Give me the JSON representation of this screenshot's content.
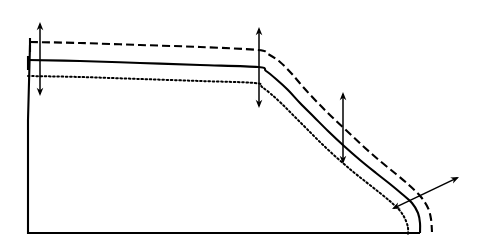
{
  "figure": {
    "type": "line-diagram",
    "width": 485,
    "height": 249,
    "background_color": "#ffffff",
    "stroke_color": "#000000"
  },
  "chart_data": {
    "type": "line",
    "title": "",
    "xlabel": "",
    "ylabel": "",
    "grid": false,
    "legend": "none",
    "xlim": [
      0,
      485
    ],
    "ylim": [
      0,
      249
    ],
    "note": "Three profile curves (dashed, solid, dotted) sharing a flat upper plateau, a step/kink near x=260, an S-shaped descent, and a near-vertical tail meeting the baseline. Coordinates are in image pixel space with y increasing downward.",
    "series": [
      {
        "name": "upper-profile-dashed",
        "style": "dashed",
        "dash_pattern": "8 4",
        "stroke_width": 2.1,
        "points": [
          [
            30,
            42
          ],
          [
            80,
            43
          ],
          [
            140,
            45
          ],
          [
            200,
            47
          ],
          [
            258,
            50
          ],
          [
            268,
            54
          ],
          [
            280,
            62
          ],
          [
            292,
            74
          ],
          [
            304,
            88
          ],
          [
            318,
            103
          ],
          [
            332,
            117
          ],
          [
            348,
            132
          ],
          [
            364,
            147
          ],
          [
            380,
            161
          ],
          [
            396,
            174
          ],
          [
            410,
            186
          ],
          [
            421,
            197
          ],
          [
            428,
            208
          ],
          [
            431,
            219
          ],
          [
            432,
            232
          ]
        ]
      },
      {
        "name": "middle-profile-solid",
        "style": "solid",
        "dash_pattern": "none",
        "stroke_width": 2.1,
        "points": [
          [
            28,
            60
          ],
          [
            80,
            61
          ],
          [
            140,
            63
          ],
          [
            200,
            65
          ],
          [
            258,
            67
          ],
          [
            266,
            71
          ],
          [
            276,
            79
          ],
          [
            288,
            90
          ],
          [
            300,
            103
          ],
          [
            314,
            117
          ],
          [
            328,
            131
          ],
          [
            344,
            146
          ],
          [
            360,
            160
          ],
          [
            376,
            173
          ],
          [
            390,
            184
          ],
          [
            402,
            194
          ],
          [
            412,
            203
          ],
          [
            418,
            213
          ],
          [
            420,
            223
          ],
          [
            420,
            233
          ]
        ]
      },
      {
        "name": "lower-profile-dotted",
        "style": "dotted",
        "dash_pattern": "1.6 2.6",
        "stroke_width": 2.0,
        "points": [
          [
            28,
            76
          ],
          [
            80,
            77
          ],
          [
            140,
            79
          ],
          [
            200,
            81
          ],
          [
            255,
            83
          ],
          [
            262,
            87
          ],
          [
            271,
            94
          ],
          [
            282,
            104
          ],
          [
            294,
            116
          ],
          [
            307,
            129
          ],
          [
            321,
            143
          ],
          [
            336,
            157
          ],
          [
            351,
            170
          ],
          [
            366,
            182
          ],
          [
            380,
            193
          ],
          [
            392,
            203
          ],
          [
            401,
            212
          ],
          [
            406,
            221
          ],
          [
            408,
            228
          ],
          [
            408,
            234
          ]
        ]
      }
    ],
    "domain_boundary": {
      "name": "flow-domain-outline",
      "style": "solid",
      "stroke_width": 2.1,
      "points": [
        [
          30,
          45
        ],
        [
          28,
          120
        ],
        [
          28,
          233
        ],
        [
          420,
          233
        ]
      ]
    },
    "annotations": [
      {
        "name": "left-gap-arrow",
        "kind": "double-headed-arrow",
        "orientation": "vertical",
        "x1": 40,
        "y1": 22,
        "x2": 40,
        "y2": 96
      },
      {
        "name": "step-gap-arrow",
        "kind": "double-headed-arrow",
        "orientation": "vertical",
        "x1": 259,
        "y1": 27,
        "x2": 259,
        "y2": 108
      },
      {
        "name": "midspan-gap-arrow",
        "kind": "double-headed-arrow",
        "orientation": "vertical",
        "x1": 343,
        "y1": 92,
        "x2": 343,
        "y2": 164
      },
      {
        "name": "tail-gap-arrow",
        "kind": "double-headed-arrow",
        "orientation": "diagonal",
        "x1": 392,
        "y1": 209,
        "x2": 459,
        "y2": 177
      }
    ],
    "tick_marks": [
      {
        "name": "dashed-start-tick",
        "x": 30,
        "y1": 38,
        "y2": 52
      },
      {
        "name": "solid-start-tick",
        "x": 28,
        "y1": 56,
        "y2": 70
      }
    ]
  }
}
